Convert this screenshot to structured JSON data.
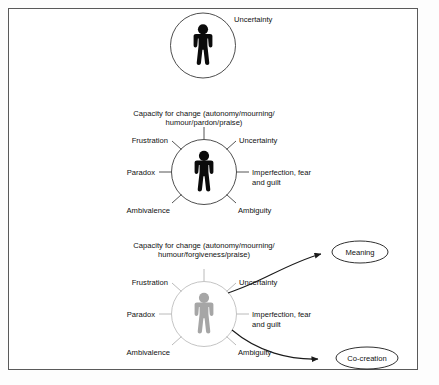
{
  "figure": {
    "panels": [
      {
        "id": "panel-top",
        "person_style": "dark",
        "labels": [
          {
            "key": "uncertainty",
            "text": "Uncertainty"
          }
        ]
      },
      {
        "id": "panel-middle",
        "person_style": "dark",
        "labels": [
          {
            "key": "capacity-line1",
            "text": "Capacity for change (autonomy/mourning/"
          },
          {
            "key": "capacity-line2",
            "text": "humour/pardon/praise)"
          },
          {
            "key": "frustration",
            "text": "Frustration"
          },
          {
            "key": "uncertainty",
            "text": "Uncertainty"
          },
          {
            "key": "paradox",
            "text": "Paradox"
          },
          {
            "key": "imperfection-line1",
            "text": "Imperfection, fear"
          },
          {
            "key": "imperfection-line2",
            "text": "and guilt"
          },
          {
            "key": "ambivalence",
            "text": "Ambivalence"
          },
          {
            "key": "ambiguity",
            "text": "Ambiguity"
          }
        ]
      },
      {
        "id": "panel-bottom",
        "person_style": "light",
        "labels": [
          {
            "key": "capacity-line1",
            "text": "Capacity for change (autonomy/mourning/"
          },
          {
            "key": "capacity-line2",
            "text": "humour/forgiveness/praise)"
          },
          {
            "key": "frustration",
            "text": "Frustration"
          },
          {
            "key": "uncertainty",
            "text": "Uncertainty"
          },
          {
            "key": "paradox",
            "text": "Paradox"
          },
          {
            "key": "imperfection-line1",
            "text": "Imperfection, fear"
          },
          {
            "key": "imperfection-line2",
            "text": "and guilt"
          },
          {
            "key": "ambivalence",
            "text": "Ambivalence"
          },
          {
            "key": "ambiguity",
            "text": "Ambiguity"
          }
        ],
        "outcomes": [
          {
            "key": "meaning",
            "text": "Meaning"
          },
          {
            "key": "co-creation",
            "text": "Co-creation"
          }
        ]
      }
    ],
    "colors": {
      "frame_border": "#5a5a5a",
      "person_dark": "#0b0b0b",
      "person_light": "#a6a6a6",
      "ring_dark": "#3a3a3a",
      "ring_light": "#bdbdbd",
      "arrow": "#1a1a1a",
      "text": "#111111",
      "background": "#ffffff"
    }
  }
}
